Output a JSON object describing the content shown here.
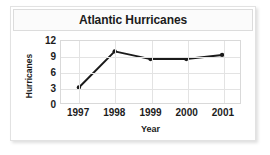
{
  "chart_data": {
    "type": "line",
    "title": "Atlantic Hurricanes",
    "xlabel": "Year",
    "ylabel": "Hurricanes",
    "categories": [
      "1997",
      "1998",
      "1999",
      "2000",
      "2001"
    ],
    "values": [
      3,
      10,
      8.5,
      8.5,
      9.3
    ],
    "series": [
      {
        "name": "Hurricanes",
        "values": [
          3,
          10,
          8.5,
          8.5,
          9.3
        ]
      }
    ],
    "ylim": [
      0,
      12
    ],
    "yticks": [
      12,
      9,
      6,
      3,
      0
    ],
    "xticks": [
      "1997",
      "1998",
      "1999",
      "2000",
      "2001"
    ],
    "grid": true,
    "legend": false,
    "line_color": "#1a1a1a",
    "marker": "circle",
    "marker_color": "#1a1a1a"
  }
}
